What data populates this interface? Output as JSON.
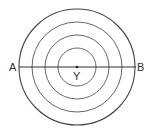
{
  "diagram": {
    "type": "concentric-circles",
    "center": {
      "x": 77,
      "y": 67
    },
    "radii": [
      58,
      45,
      32,
      19
    ],
    "stroke_color": "#444444",
    "line": {
      "x1": 19,
      "x2": 136,
      "y": 67
    },
    "labels": {
      "left": "A",
      "right": "B",
      "center": "Y"
    }
  }
}
